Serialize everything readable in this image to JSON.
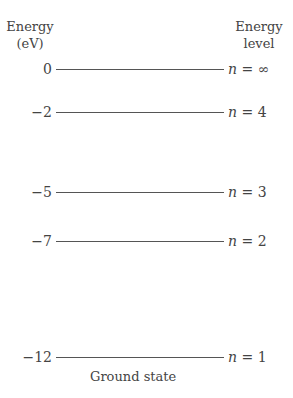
{
  "header": {
    "left_line1": "Energy",
    "left_line2": "(eV)",
    "right_line1": "Energy",
    "right_line2": "level"
  },
  "levels": [
    {
      "energy": "0",
      "n_var": "n",
      "n_eq": " = ∞"
    },
    {
      "energy": "−2",
      "n_var": "n",
      "n_eq": " = 4"
    },
    {
      "energy": "−5",
      "n_var": "n",
      "n_eq": " = 3"
    },
    {
      "energy": "−7",
      "n_var": "n",
      "n_eq": " = 2"
    },
    {
      "energy": "−12",
      "n_var": "n",
      "n_eq": " = 1"
    }
  ],
  "ground_state_label": "Ground state"
}
